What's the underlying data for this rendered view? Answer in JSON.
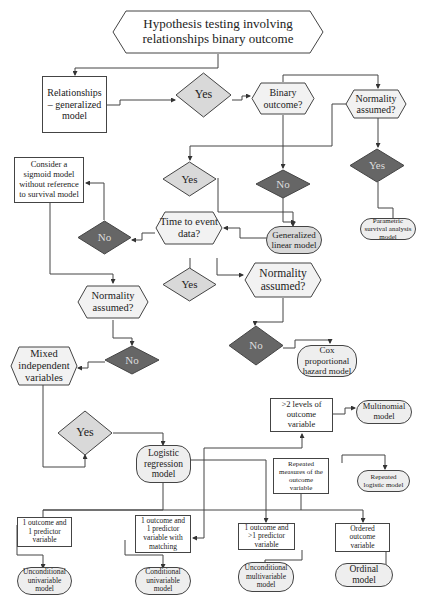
{
  "title": "Hypothesis testing involving relationships binary outcome",
  "colors": {
    "line": "#444444",
    "light_fill": "#d9d9d9",
    "dark_fill": "#666666",
    "hex_fill": "#f2f2f2",
    "term_fill": "#eeeeee"
  },
  "nodes": {
    "start": "Hypothesis testing involving relationships binary outcome",
    "relationships": "Relationships – generalized model",
    "yes1": "Yes",
    "binary": "Binary outcome?",
    "normality1": "Normality assumed?",
    "yes_right": "Yes",
    "parametric": "Parametric survival analysis model",
    "sigmoid": "Consider a sigmoid model without reference to survival model",
    "yes2": "Yes",
    "no1": "No",
    "no_left": "No",
    "time": "Time to event data?",
    "glm": "Generalized linear model",
    "yes3": "Yes",
    "normality2": "Normality assumed?",
    "normality3": "Normality assumed?",
    "no2": "No",
    "cox": "Cox proportional hazard model",
    "mixed": "Mixed independent variables",
    "no3": "No",
    "yes4": "Yes",
    "logistic": "Logistic regression model",
    "levels": ">2 levels of outcome variable",
    "multinomial": "Multinomial model",
    "repeated": "Repeated measures of the outcome variable",
    "repeated_logistic": "Repeated logistic model",
    "o1p1": "1 outcome and 1 predictor variable",
    "o1p1m": "1 outcome and 1 predictor variable with matching",
    "o1pn": "1 outcome and >1 predictor variable",
    "ordered": "Ordered outcome variable",
    "uncond_uni": "Unconditional univariable model",
    "cond_uni": "Conditional univariable model",
    "uncond_multi": "Unconditional multivariable model",
    "ordinal": "Ordinal model"
  }
}
